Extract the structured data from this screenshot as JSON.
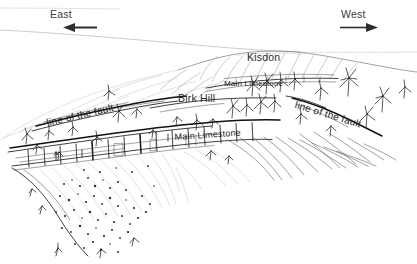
{
  "figure": {
    "kind": "geological-field-sketch",
    "background_color": "#ffffff",
    "ink_color": "#1d1d1d",
    "faint_ink_color": "#9a9a9a"
  },
  "compass": {
    "left": {
      "label": "East",
      "arrow_icon": "arrow-left-icon",
      "direction": "left"
    },
    "right": {
      "label": "West",
      "arrow_icon": "arrow-right-icon",
      "direction": "right"
    }
  },
  "annotations": {
    "summit": "Kisdon",
    "mid_spur": "Birk Hill",
    "limestone_upper": "Main Limestone",
    "limestone_lower": "Main  Limestone",
    "fault_left": "line of the fault",
    "fault_right": "line of the fault"
  },
  "scene_elements": {
    "horizon": "distant-horizon-line",
    "skyline": "kisdon-hill-skyline",
    "upper_bench": "main-limestone-upper-bench",
    "lower_scar": "main-limestone-lower-scar",
    "fault_trace_left": "fault-trace-left",
    "fault_trace_right": "fault-trace-right",
    "scree": "stippled-scree-slope",
    "shrubs": "shrub-and-tree-cluster",
    "hillside_hatching": "hillside-slope-hatching"
  }
}
